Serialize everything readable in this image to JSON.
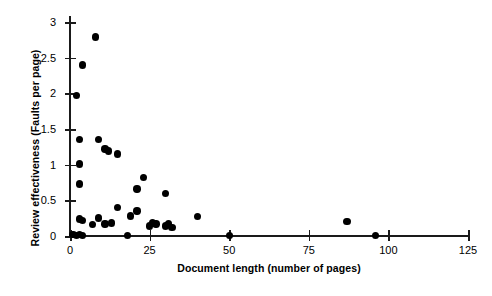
{
  "chart_data": {
    "type": "scatter",
    "title": "",
    "xlabel": "Document length (number of pages)",
    "ylabel": "Review effectiveness (Faults per page)",
    "xlim": [
      0,
      125
    ],
    "ylim": [
      0,
      3
    ],
    "xticks": [
      0,
      25,
      50,
      75,
      100,
      125
    ],
    "xticklabels": [
      "0",
      "25",
      "50",
      "75",
      "100",
      "125"
    ],
    "yticks": [
      0,
      0.5,
      1,
      1.5,
      2,
      2.5,
      3
    ],
    "yticklabels": [
      "0",
      "0.5",
      "1",
      "1.5",
      "2",
      "2.5",
      "3"
    ],
    "grid": false,
    "legend": null,
    "marker": "filled-circle",
    "marker_color": "#000000",
    "points": [
      {
        "x": 8,
        "y": 2.79
      },
      {
        "x": 4,
        "y": 2.4
      },
      {
        "x": 2,
        "y": 1.97
      },
      {
        "x": 3,
        "y": 1.35
      },
      {
        "x": 9,
        "y": 1.35
      },
      {
        "x": 11,
        "y": 1.22
      },
      {
        "x": 12,
        "y": 1.19
      },
      {
        "x": 15,
        "y": 1.15
      },
      {
        "x": 3,
        "y": 1.01
      },
      {
        "x": 3,
        "y": 0.73
      },
      {
        "x": 23,
        "y": 0.82
      },
      {
        "x": 21,
        "y": 0.66
      },
      {
        "x": 30,
        "y": 0.6
      },
      {
        "x": 15,
        "y": 0.4
      },
      {
        "x": 21,
        "y": 0.35
      },
      {
        "x": 19,
        "y": 0.28
      },
      {
        "x": 40,
        "y": 0.27
      },
      {
        "x": 3,
        "y": 0.24
      },
      {
        "x": 4,
        "y": 0.22
      },
      {
        "x": 9,
        "y": 0.25
      },
      {
        "x": 13,
        "y": 0.18
      },
      {
        "x": 7,
        "y": 0.16
      },
      {
        "x": 11,
        "y": 0.17
      },
      {
        "x": 25,
        "y": 0.14
      },
      {
        "x": 26,
        "y": 0.18
      },
      {
        "x": 27,
        "y": 0.17
      },
      {
        "x": 30,
        "y": 0.14
      },
      {
        "x": 31,
        "y": 0.17
      },
      {
        "x": 32,
        "y": 0.12
      },
      {
        "x": 87,
        "y": 0.2
      },
      {
        "x": 1,
        "y": 0.02
      },
      {
        "x": 2,
        "y": 0.01
      },
      {
        "x": 3,
        "y": 0.02
      },
      {
        "x": 4,
        "y": 0.01
      },
      {
        "x": 18,
        "y": 0.01
      },
      {
        "x": 50,
        "y": 0.01
      },
      {
        "x": 96,
        "y": 0.01
      }
    ]
  }
}
